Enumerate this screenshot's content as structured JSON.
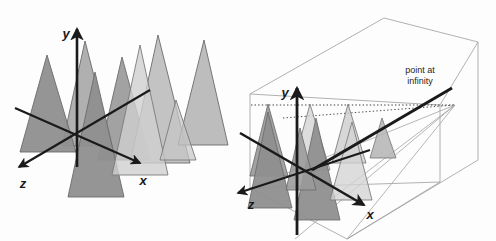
{
  "figure": {
    "background_color": "#fdfdfd",
    "width": 496,
    "height": 241
  },
  "palette": {
    "tree_dark": "#9a9a9a",
    "tree_mid": "#b4b4b4",
    "tree_light": "#cfcfcf",
    "tree_lighter": "#dedede",
    "tree_outline": "#6b6b6b",
    "axis_color": "#1a1a1a",
    "box_line": "#9d9d9d",
    "dotted_line": "#4a4a4a",
    "ray_line": "#9d9d9d",
    "text_color": "#1d1d1d"
  },
  "panels": [
    {
      "id": "left-panel",
      "name": "parallel-projection-panel",
      "axes": [
        {
          "id": "y",
          "label": "y",
          "label_x": 66,
          "label_y": 38,
          "direction": "up"
        },
        {
          "id": "z",
          "label": "z",
          "label_x": 56,
          "label_y": 188,
          "direction": "down-left"
        },
        {
          "id": "x",
          "label": "x",
          "label_x": 140,
          "label_y": 185,
          "direction": "down-right"
        }
      ],
      "annotations": [],
      "tree_count": 8
    },
    {
      "id": "right-panel",
      "name": "perspective-projection-panel",
      "axes": [
        {
          "id": "y",
          "label": "y",
          "label_x": 285,
          "label_y": 97,
          "direction": "up"
        },
        {
          "id": "z",
          "label": "z",
          "label_x": 251,
          "label_y": 206,
          "direction": "down-left"
        },
        {
          "id": "x",
          "label": "x",
          "label_x": 368,
          "label_y": 218,
          "direction": "down-right"
        }
      ],
      "annotations": [
        {
          "id": "point-at-infinity",
          "line1": "point at",
          "line2": "infinity",
          "x": 420,
          "y1": 73,
          "y2": 84
        }
      ],
      "tree_count": 8,
      "has_wireframe_box": true,
      "vanishing_point": {
        "x": 455,
        "y": 105
      }
    }
  ],
  "icons": {
    "arrow_head": "arrowhead-icon",
    "axis_arrow": "axis-arrow-icon"
  }
}
